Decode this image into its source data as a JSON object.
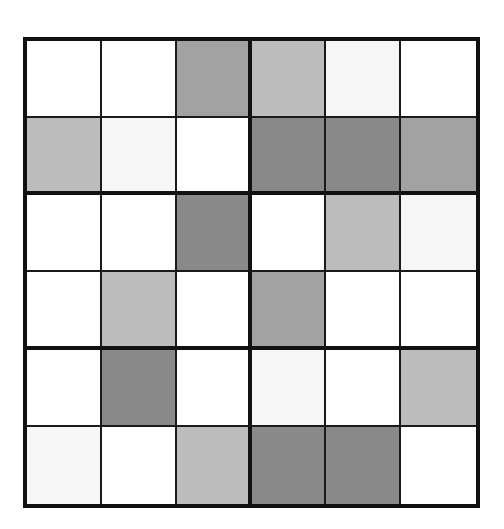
{
  "puzzle": {
    "type": "shaded-grid",
    "rows": 6,
    "cols": 6,
    "box_rows": 2,
    "box_cols": 3,
    "colors": {
      "white": "#ffffff",
      "very_light": "#f6f6f6",
      "light": "#bcbcbc",
      "mid": "#a2a2a2",
      "dark": "#898989",
      "border": "#111111"
    },
    "cells": [
      [
        "white",
        "white",
        "mid",
        "light",
        "very_light",
        "white"
      ],
      [
        "light",
        "very_light",
        "white",
        "dark",
        "dark",
        "mid"
      ],
      [
        "white",
        "white",
        "dark",
        "white",
        "light",
        "very_light"
      ],
      [
        "white",
        "light",
        "white",
        "mid",
        "white",
        "white"
      ],
      [
        "white",
        "dark",
        "white",
        "very_light",
        "white",
        "light"
      ],
      [
        "very_light",
        "white",
        "light",
        "dark",
        "dark",
        "white"
      ]
    ]
  }
}
